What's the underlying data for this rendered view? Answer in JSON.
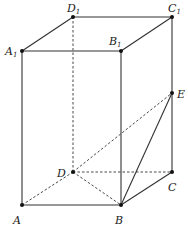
{
  "diagram": {
    "type": "rectangular-prism",
    "points": {
      "A": {
        "label": "A",
        "sub": "",
        "x": 22,
        "y": 205,
        "lx": 13,
        "ly": 224
      },
      "B": {
        "label": "B",
        "sub": "",
        "x": 121,
        "y": 205,
        "lx": 115,
        "ly": 224
      },
      "C": {
        "label": "C",
        "sub": "",
        "x": 172,
        "y": 172,
        "lx": 168,
        "ly": 191
      },
      "D": {
        "label": "D",
        "sub": "",
        "x": 73,
        "y": 172,
        "lx": 57,
        "ly": 177
      },
      "A1": {
        "label": "A",
        "sub": "1",
        "x": 22,
        "y": 51,
        "lx": 5,
        "ly": 55
      },
      "B1": {
        "label": "B",
        "sub": "1",
        "x": 121,
        "y": 51,
        "lx": 109,
        "ly": 45
      },
      "C1": {
        "label": "C",
        "sub": "1",
        "x": 172,
        "y": 17,
        "lx": 168,
        "ly": 12
      },
      "D1": {
        "label": "D",
        "sub": "1",
        "x": 73,
        "y": 17,
        "lx": 67,
        "ly": 12
      },
      "E": {
        "label": "E",
        "sub": "",
        "x": 172,
        "y": 93,
        "lx": 177,
        "ly": 98
      }
    },
    "solid_edges": [
      [
        "A1",
        "B1"
      ],
      [
        "B1",
        "C1"
      ],
      [
        "C1",
        "D1"
      ],
      [
        "D1",
        "A1"
      ],
      [
        "A",
        "B"
      ],
      [
        "B",
        "C"
      ],
      [
        "A",
        "A1"
      ],
      [
        "B",
        "B1"
      ],
      [
        "C",
        "C1"
      ],
      [
        "B",
        "E"
      ]
    ],
    "dashed_edges": [
      [
        "A",
        "D"
      ],
      [
        "D",
        "C"
      ],
      [
        "D",
        "D1"
      ],
      [
        "D",
        "B"
      ],
      [
        "D",
        "E"
      ]
    ],
    "colors": {
      "line": "#333333",
      "point": "#111111",
      "label": "#222222"
    }
  }
}
